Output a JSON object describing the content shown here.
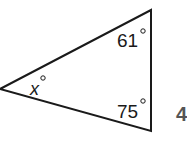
{
  "diagram": {
    "type": "triangle",
    "angles": {
      "left": {
        "label": "x",
        "unit": "°"
      },
      "top_right": {
        "label": "61",
        "unit": "°"
      },
      "bottom_right": {
        "label": "75",
        "unit": "°"
      }
    },
    "problem_number": "4",
    "stroke_color": "#1a1a1a"
  }
}
